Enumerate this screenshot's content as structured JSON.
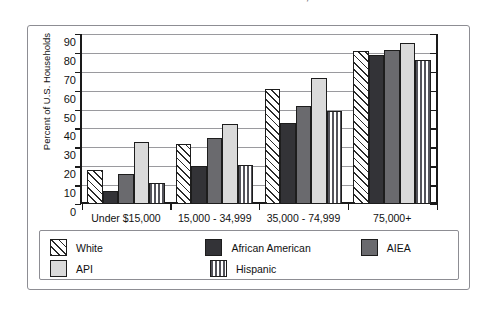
{
  "title_sliver": "BY INCOME BY RACE GROUP, 1999",
  "chart_data": {
    "type": "bar",
    "title": "",
    "xlabel": "",
    "ylabel": "Percent of U.S. Households",
    "ylim": [
      0,
      90
    ],
    "yticks": [
      90,
      80,
      70,
      60,
      50,
      40,
      30,
      20,
      10,
      0
    ],
    "grid": true,
    "legend_position": "bottom",
    "categories": [
      "Under $15,000",
      "15,000 - 34,999",
      "35,000 - 74,999",
      "75,000+"
    ],
    "series": [
      {
        "name": "White",
        "pattern": "diagonal-hatch",
        "color": "#ffffff",
        "values": [
          18,
          32,
          61,
          81
        ]
      },
      {
        "name": "African American",
        "pattern": "solid",
        "color": "#333337",
        "values": [
          7,
          20,
          43,
          79
        ]
      },
      {
        "name": "AIEA",
        "pattern": "solid",
        "color": "#6a6a6e",
        "values": [
          16,
          35,
          52,
          81.5
        ]
      },
      {
        "name": "API",
        "pattern": "solid",
        "color": "#dadada",
        "values": [
          33,
          42.5,
          66.5,
          85
        ]
      },
      {
        "name": "Hispanic",
        "pattern": "vertical-stripe",
        "color": "#ffffff",
        "values": [
          11,
          20.5,
          49.5,
          76
        ]
      }
    ]
  }
}
